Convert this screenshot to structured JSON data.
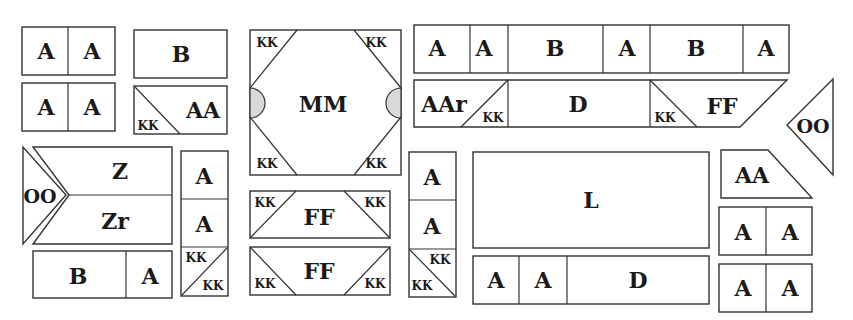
{
  "colors": {
    "stroke": "#333333",
    "fill": "#ffffff",
    "semicircle": "#d9d9d9",
    "text": "#1a1a1a"
  },
  "shapes": [
    {
      "id": "aa-pair-top-left",
      "type": "rect",
      "x": 22,
      "y": 27,
      "w": 93,
      "h": 48,
      "dividers_x": [
        68
      ]
    },
    {
      "id": "aa-pair-second-left",
      "type": "rect",
      "x": 22,
      "y": 83,
      "w": 93,
      "h": 48,
      "dividers_x": [
        68
      ]
    },
    {
      "id": "b-box-top",
      "type": "rect",
      "x": 134,
      "y": 30,
      "w": 93,
      "h": 48
    },
    {
      "id": "kk-aa-box",
      "type": "rect",
      "x": 134,
      "y": 86,
      "w": 93,
      "h": 48,
      "lines": [
        [
          135,
          87,
          180,
          134
        ]
      ]
    },
    {
      "id": "oo-z-zr-block",
      "type": "poly",
      "points": "33,147 172,147 172,244 33,244 69,195",
      "lines": [
        [
          69,
          195,
          172,
          195
        ]
      ]
    },
    {
      "id": "oo-left-triangle",
      "type": "poly",
      "points": "23,147 23,244 66,195"
    },
    {
      "id": "b-a-bar",
      "type": "rect",
      "x": 33,
      "y": 251,
      "w": 139,
      "h": 47,
      "dividers_x": [
        126
      ]
    },
    {
      "id": "a-a-kk-column-left",
      "type": "rect",
      "x": 181,
      "y": 151,
      "w": 47,
      "h": 145,
      "dividers_y": [
        199,
        247
      ],
      "lines": [
        [
          182,
          295,
          227,
          248
        ]
      ]
    },
    {
      "id": "mm-block",
      "type": "rect",
      "x": 250,
      "y": 30,
      "w": 151,
      "h": 145,
      "lines": [
        [
          250,
          88,
          297,
          30
        ],
        [
          354,
          30,
          401,
          88
        ],
        [
          250,
          117,
          297,
          175
        ],
        [
          354,
          175,
          401,
          117
        ]
      ],
      "semis": [
        {
          "cx": 250,
          "cy": 103,
          "r": 15,
          "side": "left"
        },
        {
          "cx": 401,
          "cy": 103,
          "r": 15,
          "side": "right"
        }
      ]
    },
    {
      "id": "ff-block-1",
      "type": "rect",
      "x": 250,
      "y": 191,
      "w": 140,
      "h": 47,
      "lines": [
        [
          250,
          238,
          296,
          191
        ],
        [
          344,
          191,
          390,
          238
        ]
      ]
    },
    {
      "id": "ff-block-2",
      "type": "rect",
      "x": 250,
      "y": 247,
      "w": 140,
      "h": 48,
      "lines": [
        [
          250,
          247,
          296,
          295
        ],
        [
          344,
          295,
          390,
          247
        ]
      ]
    },
    {
      "id": "a-a-kk-column-mid",
      "type": "rect",
      "x": 409,
      "y": 152,
      "w": 47,
      "h": 145,
      "dividers_y": [
        200,
        249
      ],
      "lines": [
        [
          410,
          250,
          455,
          296
        ]
      ]
    },
    {
      "id": "top-row-bar",
      "type": "rect",
      "x": 414,
      "y": 25,
      "w": 375,
      "h": 48,
      "dividers_x": [
        470,
        508,
        603,
        650,
        743
      ]
    },
    {
      "id": "aar-d-ff-bar",
      "type": "poly",
      "points": "414,80 787,80 740,127 414,127",
      "dividers_x_full": [
        508,
        650
      ],
      "lines": [
        [
          461,
          127,
          508,
          80
        ],
        [
          650,
          80,
          697,
          127
        ]
      ]
    },
    {
      "id": "oo-right-triangle",
      "type": "poly",
      "points": "833,79 787,125 833,175"
    },
    {
      "id": "l-box",
      "type": "rect",
      "x": 473,
      "y": 152,
      "w": 236,
      "h": 96
    },
    {
      "id": "a-a-d-bar",
      "type": "rect",
      "x": 473,
      "y": 256,
      "w": 236,
      "h": 48,
      "dividers_x": [
        519,
        567
      ]
    },
    {
      "id": "aa-trapezoid",
      "type": "poly",
      "points": "721,150 768,150 812,198 721,198"
    },
    {
      "id": "aa-pair-right-1",
      "type": "rect",
      "x": 719,
      "y": 207,
      "w": 93,
      "h": 48,
      "dividers_x": [
        766
      ]
    },
    {
      "id": "aa-pair-right-2",
      "type": "rect",
      "x": 719,
      "y": 264,
      "w": 93,
      "h": 48,
      "dividers_x": [
        766
      ]
    }
  ],
  "labels": [
    {
      "text": "A",
      "x": 46,
      "y": 51,
      "size": "big"
    },
    {
      "text": "A",
      "x": 92,
      "y": 51,
      "size": "big"
    },
    {
      "text": "A",
      "x": 46,
      "y": 107,
      "size": "big"
    },
    {
      "text": "A",
      "x": 92,
      "y": 107,
      "size": "big"
    },
    {
      "text": "B",
      "x": 181,
      "y": 54,
      "size": "big"
    },
    {
      "text": "AA",
      "x": 203,
      "y": 110,
      "size": "big"
    },
    {
      "text": "KK",
      "x": 148,
      "y": 126,
      "size": "small"
    },
    {
      "text": "OO",
      "x": 40,
      "y": 196,
      "size": "med"
    },
    {
      "text": "Z",
      "x": 120,
      "y": 171,
      "size": "big"
    },
    {
      "text": "Zr",
      "x": 115,
      "y": 221,
      "size": "big"
    },
    {
      "text": "B",
      "x": 78,
      "y": 276,
      "size": "big"
    },
    {
      "text": "A",
      "x": 150,
      "y": 276,
      "size": "big"
    },
    {
      "text": "A",
      "x": 204,
      "y": 176,
      "size": "big"
    },
    {
      "text": "A",
      "x": 204,
      "y": 224,
      "size": "big"
    },
    {
      "text": "KK",
      "x": 196,
      "y": 258,
      "size": "small"
    },
    {
      "text": "KK",
      "x": 213,
      "y": 286,
      "size": "small"
    },
    {
      "text": "MM",
      "x": 323,
      "y": 104,
      "size": "big"
    },
    {
      "text": "KK",
      "x": 267,
      "y": 43,
      "size": "small"
    },
    {
      "text": "KK",
      "x": 376,
      "y": 43,
      "size": "small"
    },
    {
      "text": "KK",
      "x": 267,
      "y": 164,
      "size": "small"
    },
    {
      "text": "KK",
      "x": 376,
      "y": 164,
      "size": "small"
    },
    {
      "text": "FF",
      "x": 319,
      "y": 217,
      "size": "big"
    },
    {
      "text": "KK",
      "x": 265,
      "y": 203,
      "size": "small"
    },
    {
      "text": "KK",
      "x": 375,
      "y": 203,
      "size": "small"
    },
    {
      "text": "FF",
      "x": 319,
      "y": 271,
      "size": "big"
    },
    {
      "text": "KK",
      "x": 265,
      "y": 284,
      "size": "small"
    },
    {
      "text": "KK",
      "x": 375,
      "y": 284,
      "size": "small"
    },
    {
      "text": "A",
      "x": 432,
      "y": 177,
      "size": "big"
    },
    {
      "text": "A",
      "x": 432,
      "y": 226,
      "size": "big"
    },
    {
      "text": "KK",
      "x": 440,
      "y": 260,
      "size": "small"
    },
    {
      "text": "KK",
      "x": 422,
      "y": 286,
      "size": "small"
    },
    {
      "text": "A",
      "x": 437,
      "y": 48,
      "size": "big"
    },
    {
      "text": "A",
      "x": 484,
      "y": 48,
      "size": "big"
    },
    {
      "text": "B",
      "x": 555,
      "y": 48,
      "size": "big"
    },
    {
      "text": "A",
      "x": 627,
      "y": 48,
      "size": "big"
    },
    {
      "text": "B",
      "x": 696,
      "y": 48,
      "size": "big"
    },
    {
      "text": "A",
      "x": 766,
      "y": 48,
      "size": "big"
    },
    {
      "text": "AAr",
      "x": 444,
      "y": 104,
      "size": "big"
    },
    {
      "text": "KK",
      "x": 493,
      "y": 118,
      "size": "small"
    },
    {
      "text": "D",
      "x": 578,
      "y": 104,
      "size": "big"
    },
    {
      "text": "KK",
      "x": 665,
      "y": 118,
      "size": "small"
    },
    {
      "text": "FF",
      "x": 722,
      "y": 106,
      "size": "big"
    },
    {
      "text": "OO",
      "x": 813,
      "y": 126,
      "size": "med"
    },
    {
      "text": "L",
      "x": 591,
      "y": 200,
      "size": "big"
    },
    {
      "text": "A",
      "x": 496,
      "y": 280,
      "size": "big"
    },
    {
      "text": "A",
      "x": 543,
      "y": 280,
      "size": "big"
    },
    {
      "text": "D",
      "x": 638,
      "y": 280,
      "size": "big"
    },
    {
      "text": "AA",
      "x": 752,
      "y": 175,
      "size": "big"
    },
    {
      "text": "A",
      "x": 743,
      "y": 232,
      "size": "big"
    },
    {
      "text": "A",
      "x": 790,
      "y": 232,
      "size": "big"
    },
    {
      "text": "A",
      "x": 743,
      "y": 288,
      "size": "big"
    },
    {
      "text": "A",
      "x": 790,
      "y": 288,
      "size": "big"
    }
  ]
}
